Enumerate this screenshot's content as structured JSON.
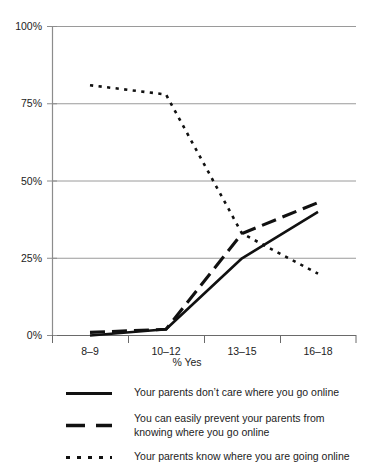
{
  "chart_data": {
    "type": "line",
    "title": "",
    "subtitle": "",
    "xlabel": "% Yes",
    "ylabel": "",
    "categories": [
      "8–9",
      "10–12",
      "13–15",
      "16–18"
    ],
    "ylim": [
      0,
      100
    ],
    "yticks": [
      0,
      25,
      50,
      75,
      100
    ],
    "ytick_labels": [
      "0%",
      "25%",
      "50%",
      "75%",
      "100%"
    ],
    "grid": true,
    "legend_position": "bottom",
    "series": [
      {
        "name": "Your parents don't care where you go online",
        "style": "solid",
        "color": "#111111",
        "values": [
          0,
          2,
          25,
          40
        ]
      },
      {
        "name": "You can easily prevent your parents from knowing where you go online",
        "style": "dashed",
        "color": "#111111",
        "values": [
          1,
          2,
          33,
          43
        ]
      },
      {
        "name": "Your parents know where you are going online",
        "style": "dotted",
        "color": "#111111",
        "values": [
          81,
          78,
          33,
          20
        ]
      }
    ]
  },
  "legend": {
    "items": [
      {
        "line1": "Your parents don’t care where you go online",
        "line2": ""
      },
      {
        "line1": "You can easily prevent your parents from",
        "line2": "knowing where you go online"
      },
      {
        "line1": "Your parents know where you are going online",
        "line2": ""
      }
    ]
  },
  "axis": {
    "x_title": "% Yes",
    "y_tick_0": "0%",
    "y_tick_25": "25%",
    "y_tick_50": "50%",
    "y_tick_75": "75%",
    "y_tick_100": "100%",
    "x_tick_0": "8–9",
    "x_tick_1": "10–12",
    "x_tick_2": "13–15",
    "x_tick_3": "16–18"
  }
}
